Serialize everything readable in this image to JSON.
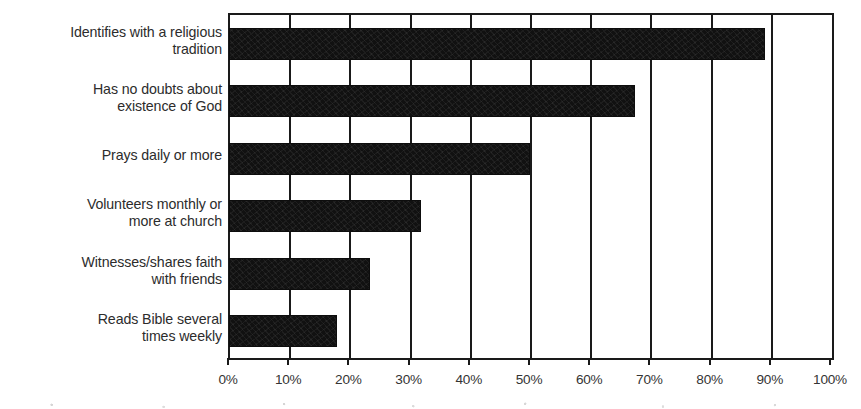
{
  "chart_data": {
    "type": "bar",
    "orientation": "horizontal",
    "title": "",
    "subtitle": "",
    "xlabel": "",
    "ylabel": "",
    "xlim": [
      0,
      100
    ],
    "grid": true,
    "legend": false,
    "legend_position": "none",
    "bar_color": "#111111",
    "axis_color": "#1a1a1a",
    "text_color": "#2c2c2c",
    "categories": [
      "Identifies with a religious tradition",
      "Has no doubts about existence of God",
      "Prays daily or more",
      "Volunteers monthly or more at church",
      "Witnesses/shares faith with friends",
      "Reads Bible several times weekly"
    ],
    "category_lines": [
      [
        "Identifies with a religious",
        "tradition"
      ],
      [
        "Has no doubts about",
        "existence of God"
      ],
      [
        "Prays daily or more"
      ],
      [
        "Volunteers monthly or",
        "more at church"
      ],
      [
        "Witnesses/shares faith",
        "with friends"
      ],
      [
        "Reads Bible several",
        "times weekly"
      ]
    ],
    "values": [
      88.7,
      67.1,
      49.7,
      31.6,
      23.1,
      17.6
    ],
    "xticks": [
      0,
      10,
      20,
      30,
      40,
      50,
      60,
      70,
      80,
      90,
      100
    ],
    "xticklabels": [
      "0%",
      "10%",
      "20%",
      "30%",
      "40%",
      "50%",
      "60%",
      "70%",
      "80%",
      "90%",
      "100%"
    ]
  }
}
